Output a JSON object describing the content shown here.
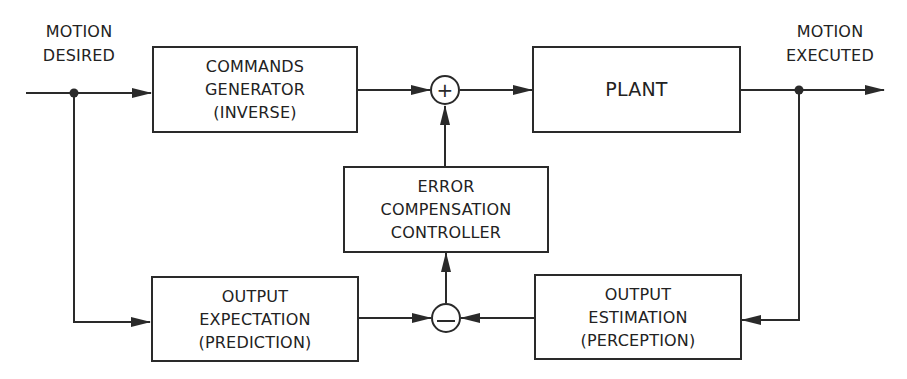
{
  "diagram": {
    "type": "control-block-diagram",
    "colors": {
      "line": "#2a2a2a",
      "text": "#222222",
      "background": "#ffffff"
    },
    "inputs": {
      "motion_desired": {
        "line1": "MOTION",
        "line2": "DESIRED"
      }
    },
    "outputs": {
      "motion_executed": {
        "line1": "MOTION",
        "line2": "EXECUTED"
      }
    },
    "blocks": {
      "commands_generator": {
        "line1": "COMMANDS",
        "line2": "GENERATOR",
        "line3": "(INVERSE)"
      },
      "plant": {
        "line1": "PLANT"
      },
      "error_compensation_controller": {
        "line1": "ERROR",
        "line2": "COMPENSATION",
        "line3": "CONTROLLER"
      },
      "output_expectation": {
        "line1": "OUTPUT",
        "line2": "EXPECTATION",
        "line3": "(PREDICTION)"
      },
      "output_estimation": {
        "line1": "OUTPUT",
        "line2": "ESTIMATION",
        "line3": "(PERCEPTION)"
      }
    },
    "junctions": {
      "sum_plus": {
        "symbol": "+"
      },
      "sum_minus": {
        "symbol": "−"
      }
    },
    "connections": [
      {
        "from": "motion_desired",
        "to": "commands_generator"
      },
      {
        "from": "motion_desired",
        "to": "output_expectation"
      },
      {
        "from": "commands_generator",
        "to": "sum_plus"
      },
      {
        "from": "error_compensation_controller",
        "to": "sum_plus"
      },
      {
        "from": "sum_plus",
        "to": "plant"
      },
      {
        "from": "plant",
        "to": "motion_executed"
      },
      {
        "from": "motion_executed",
        "to": "output_estimation"
      },
      {
        "from": "output_expectation",
        "to": "sum_minus"
      },
      {
        "from": "output_estimation",
        "to": "sum_minus"
      },
      {
        "from": "sum_minus",
        "to": "error_compensation_controller"
      }
    ]
  }
}
